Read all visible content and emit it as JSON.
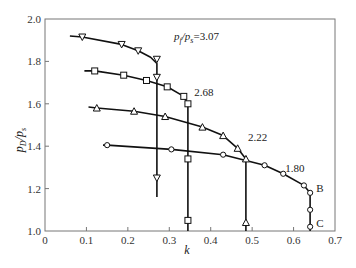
{
  "chart_data": {
    "type": "line",
    "title": "",
    "xlabel": "k",
    "ylabel": "p_D/p_s",
    "xlim": [
      0,
      0.7
    ],
    "ylim": [
      1.0,
      2.0
    ],
    "xticks": [
      "0",
      "0.1",
      "0.2",
      "0.3",
      "0.4",
      "0.5",
      "0.6",
      "0.7"
    ],
    "yticks": [
      "1.0",
      "1.2",
      "1.4",
      "1.6",
      "1.8",
      "2.0"
    ],
    "grid": false,
    "legend": "inline labels",
    "series": [
      {
        "name": "p_f/p_s=3.07",
        "label": "3.07",
        "marker": "triangle-down",
        "line": [
          [
            0.06,
            1.92
          ],
          [
            0.09,
            1.915
          ],
          [
            0.185,
            1.88
          ],
          [
            0.225,
            1.85
          ],
          [
            0.255,
            1.82
          ],
          [
            0.27,
            1.79
          ],
          [
            0.27,
            1.16
          ]
        ],
        "points": [
          [
            0.09,
            1.915
          ],
          [
            0.185,
            1.88
          ],
          [
            0.225,
            1.85
          ],
          [
            0.27,
            1.81
          ],
          [
            0.27,
            1.725
          ],
          [
            0.27,
            1.25
          ]
        ]
      },
      {
        "name": "p_f/p_s=2.68",
        "label": "2.68",
        "marker": "square",
        "line": [
          [
            0.095,
            1.755
          ],
          [
            0.12,
            1.755
          ],
          [
            0.19,
            1.735
          ],
          [
            0.245,
            1.71
          ],
          [
            0.295,
            1.68
          ],
          [
            0.335,
            1.635
          ],
          [
            0.345,
            1.6
          ],
          [
            0.345,
            1.0
          ]
        ],
        "points": [
          [
            0.12,
            1.755
          ],
          [
            0.19,
            1.735
          ],
          [
            0.245,
            1.71
          ],
          [
            0.295,
            1.68
          ],
          [
            0.335,
            1.635
          ],
          [
            0.345,
            1.6
          ],
          [
            0.345,
            1.34
          ],
          [
            0.345,
            1.05
          ]
        ]
      },
      {
        "name": "p_f/p_s=2.22",
        "label": "2.22",
        "marker": "triangle-up",
        "line": [
          [
            0.105,
            1.585
          ],
          [
            0.125,
            1.58
          ],
          [
            0.215,
            1.565
          ],
          [
            0.29,
            1.54
          ],
          [
            0.38,
            1.49
          ],
          [
            0.43,
            1.45
          ],
          [
            0.465,
            1.39
          ],
          [
            0.485,
            1.34
          ],
          [
            0.485,
            1.0
          ]
        ],
        "points": [
          [
            0.125,
            1.58
          ],
          [
            0.215,
            1.565
          ],
          [
            0.29,
            1.54
          ],
          [
            0.38,
            1.49
          ],
          [
            0.43,
            1.45
          ],
          [
            0.465,
            1.39
          ],
          [
            0.485,
            1.34
          ],
          [
            0.485,
            1.04
          ]
        ]
      },
      {
        "name": "p_f/p_s=1.80",
        "label": "1.80",
        "marker": "circle",
        "line": [
          [
            0.14,
            1.405
          ],
          [
            0.15,
            1.405
          ],
          [
            0.305,
            1.385
          ],
          [
            0.43,
            1.36
          ],
          [
            0.53,
            1.31
          ],
          [
            0.575,
            1.27
          ],
          [
            0.625,
            1.215
          ],
          [
            0.64,
            1.18
          ],
          [
            0.64,
            1.0
          ]
        ],
        "points": [
          [
            0.15,
            1.405
          ],
          [
            0.305,
            1.385
          ],
          [
            0.43,
            1.36
          ],
          [
            0.53,
            1.31
          ],
          [
            0.575,
            1.27
          ],
          [
            0.625,
            1.215
          ],
          [
            0.64,
            1.18
          ],
          [
            0.64,
            1.1
          ],
          [
            0.64,
            1.02
          ]
        ]
      }
    ],
    "annotations": [
      {
        "text": "p_f/p_s=3.07",
        "x": 0.31,
        "y": 1.9
      },
      {
        "text": "2.68",
        "x": 0.36,
        "y": 1.655
      },
      {
        "text": "2.22",
        "x": 0.49,
        "y": 1.445
      },
      {
        "text": "1.80",
        "x": 0.58,
        "y": 1.295
      },
      {
        "text": "B",
        "x": 0.655,
        "y": 1.205
      },
      {
        "text": "C",
        "x": 0.655,
        "y": 1.04
      }
    ]
  },
  "labels": {
    "top_label_main": "p",
    "top_label_sub1": "f",
    "top_label_mid": "/p",
    "top_label_sub2": "s",
    "top_label_value": "=3.07",
    "ylabel_main": "p",
    "ylabel_sub1": "D",
    "ylabel_mid": "/p",
    "ylabel_sub2": "s",
    "xlabel": "k"
  }
}
